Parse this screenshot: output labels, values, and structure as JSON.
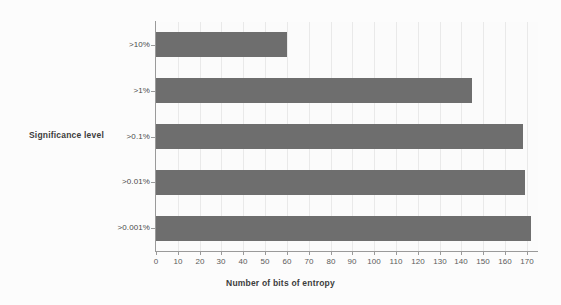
{
  "chart_data": {
    "type": "bar",
    "orientation": "horizontal",
    "title": "",
    "xlabel": "Number of bits of entropy",
    "ylabel": "Significance level",
    "categories": [
      ">10%",
      ">1%",
      ">0.1%",
      ">0.01%",
      ">0.001%"
    ],
    "values": [
      60,
      145,
      168,
      169,
      172
    ],
    "series": [
      {
        "name": "Number of bits of entropy",
        "values": [
          60,
          145,
          168,
          169,
          172
        ]
      }
    ],
    "xlim": [
      0,
      177
    ],
    "xticks": [
      0,
      10,
      20,
      30,
      40,
      50,
      60,
      70,
      80,
      90,
      100,
      110,
      120,
      130,
      140,
      150,
      160,
      170
    ],
    "xtick_labels": [
      "0",
      "10",
      "20",
      "30",
      "40",
      "50",
      "60",
      "70",
      "80",
      "90",
      "100",
      "110",
      "120",
      "130",
      "140",
      "150",
      "160",
      "170"
    ],
    "grid": "vertical",
    "legend": "none",
    "bar_color": "#6e6e6e",
    "grid_color": "#e9e9e9",
    "axis_color": "#9a9a9a",
    "background_color": "#fbfbfb"
  }
}
